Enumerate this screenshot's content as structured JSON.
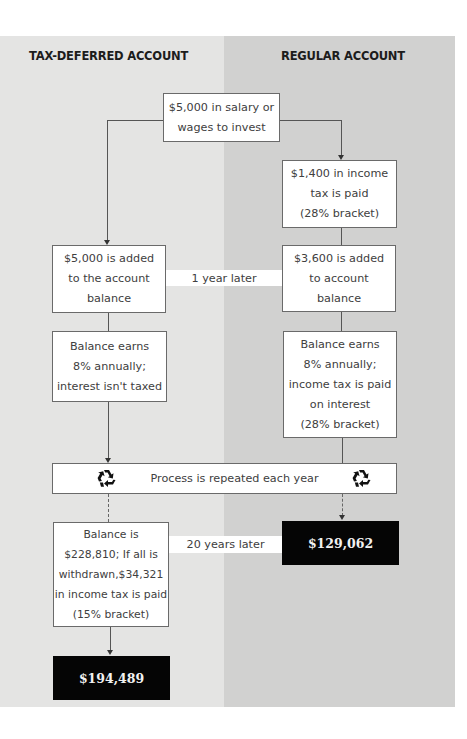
{
  "headings": {
    "left": "TAX-DEFERRED ACCOUNT",
    "right": "REGULAR ACCOUNT"
  },
  "colors": {
    "left_panel": "#e4e4e3",
    "right_panel": "#d1d1d0",
    "box_fill": "#ffffff",
    "result_fill": "#050505"
  },
  "start": {
    "text": "$5,000 in salary or\nwages to invest"
  },
  "regular": {
    "tax_paid": "$1,400 in income\ntax is paid\n(28% bracket)",
    "added": "$3,600 is added\nto account\nbalance",
    "earns": "Balance earns\n8% annually;\nincome tax is paid\non interest\n(28% bracket)",
    "result": "$129,062"
  },
  "tax_deferred": {
    "added": "$5,000 is added\nto the account\nbalance",
    "earns": "Balance earns\n8% annually;\ninterest isn't taxed",
    "final": "Balance is\n$228,810; If all is\nwithdrawn,$34,321\nin income tax is paid\n(15% bracket)",
    "result": "$194,489"
  },
  "bands": {
    "one_year": "1 year later",
    "twenty_years": "20 years later"
  },
  "process": {
    "label": "Process is repeated each year",
    "icon": "recycle-icon"
  }
}
